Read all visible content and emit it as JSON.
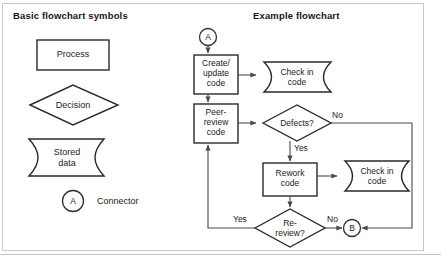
{
  "figure": {
    "left_panel_title": "Basic flowchart symbols",
    "right_panel_title": "Example flowchart"
  },
  "legend": {
    "symbols": [
      {
        "name": "process",
        "shape": "rectangle",
        "label": "Process"
      },
      {
        "name": "decision",
        "shape": "diamond",
        "label": "Decision"
      },
      {
        "name": "stored-data",
        "shape": "stored-data",
        "label": "Stored\ndata"
      },
      {
        "name": "connector",
        "shape": "circle",
        "label": "A",
        "caption": "Connector"
      }
    ]
  },
  "flowchart": {
    "nodes": [
      {
        "id": "entry-connector",
        "shape": "circle",
        "label": "A"
      },
      {
        "id": "create-update-code",
        "shape": "rectangle",
        "label": "Create/\nupdate\ncode"
      },
      {
        "id": "check-in-code-top",
        "shape": "stored-data",
        "label": "Check in\ncode"
      },
      {
        "id": "peer-review-code",
        "shape": "rectangle",
        "label": "Peer-\nreview\ncode"
      },
      {
        "id": "defects-decision",
        "shape": "diamond",
        "label": "Defects?"
      },
      {
        "id": "rework-code",
        "shape": "rectangle",
        "label": "Rework\ncode"
      },
      {
        "id": "check-in-code-bottom",
        "shape": "stored-data",
        "label": "Check in\ncode"
      },
      {
        "id": "re-review-decision",
        "shape": "diamond",
        "label": "Re-\nreview?"
      },
      {
        "id": "exit-connector",
        "shape": "circle",
        "label": "B"
      }
    ],
    "edge_labels": {
      "defects_no": "No",
      "defects_yes": "Yes",
      "rereview_yes": "Yes",
      "rereview_no": "No"
    }
  },
  "colors": {
    "stroke": "#2a2a2a",
    "line": "#4a4a4a",
    "frame": "#c9c9c9",
    "background": "#ffffff"
  }
}
